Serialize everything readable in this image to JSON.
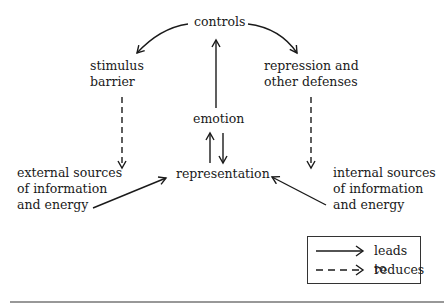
{
  "nodes": {
    "controls": "controls",
    "stimulus_barrier": [
      "stimulus",
      "barrier"
    ],
    "repression": [
      "repression and",
      "other defenses"
    ],
    "emotion": "emotion",
    "representation": "representation",
    "external": [
      "external sources",
      "of information",
      "and energy"
    ],
    "internal": [
      "internal sources",
      "of information",
      "and energy"
    ]
  },
  "legend": {
    "solid_label": "leads to",
    "dashed_label": "reduces"
  },
  "colors": {
    "ink": "#1a1a1a",
    "background": "#ffffff"
  }
}
